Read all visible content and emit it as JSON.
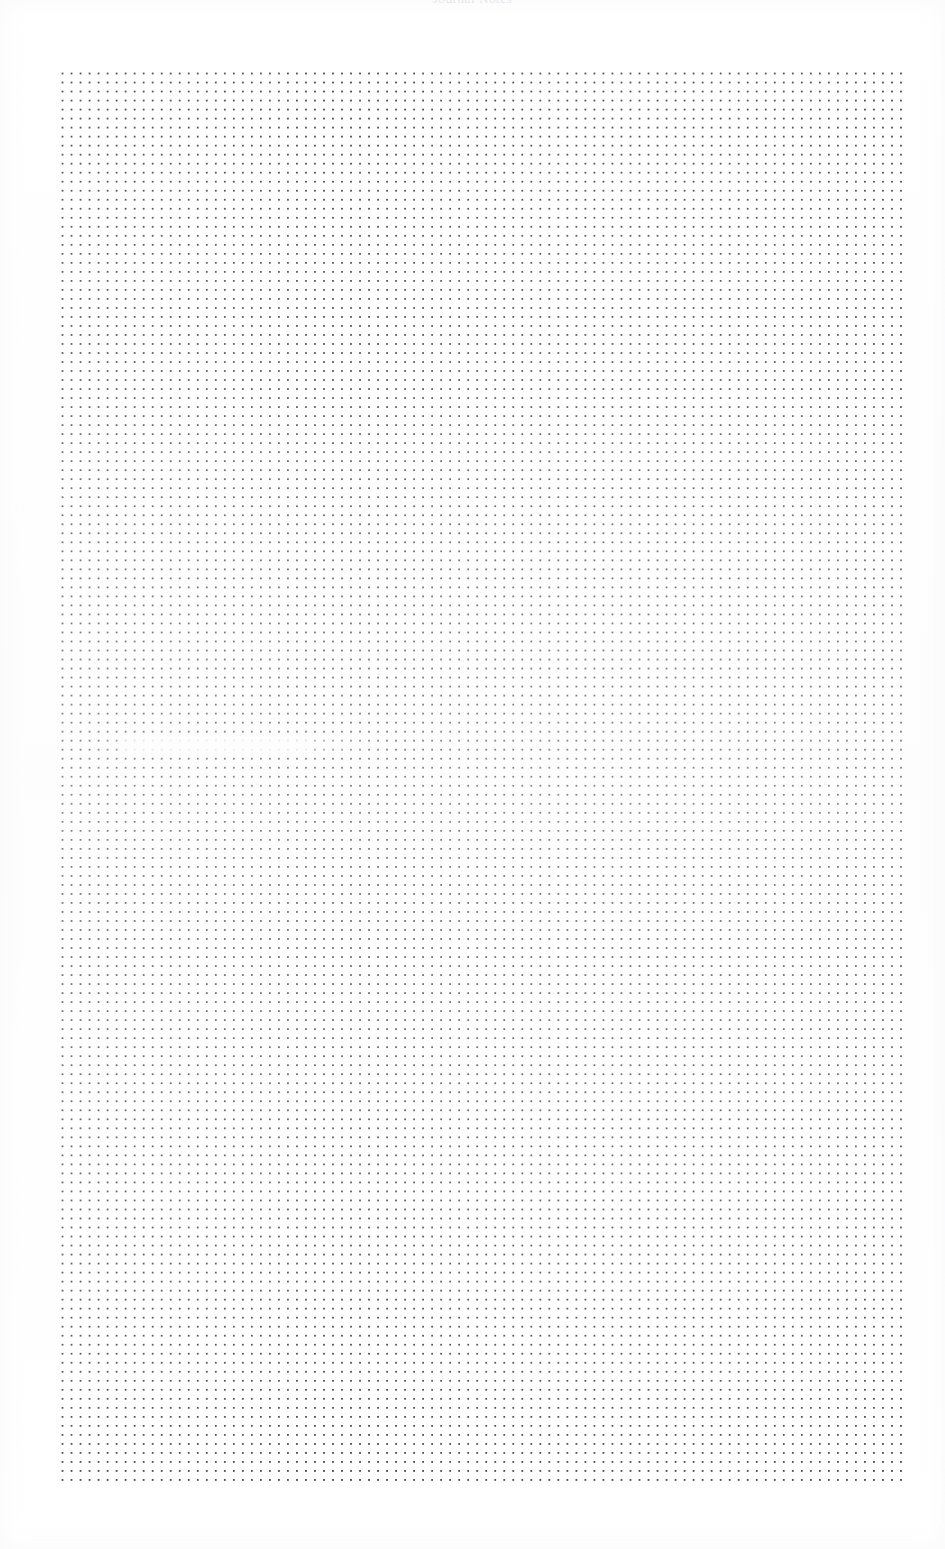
{
  "document": {
    "kind": "dot-grid-notebook-page",
    "header_text": "Journal Notes",
    "header_visibility": "clipped-at-top-edge",
    "background_color": "#ffffff",
    "page_width_px": 945,
    "page_height_px": 1549
  },
  "grid": {
    "label": "dot grid",
    "dot_color": "#4a4a52",
    "dot_spacing_px": 9,
    "dot_radius_px": 1,
    "left_px": 57,
    "top_px": 68,
    "width_px": 849,
    "height_px": 1419,
    "columns": 95,
    "rows": 158
  },
  "margins": {
    "left_px": 57,
    "right_px": 39,
    "top_px": 68,
    "bottom_px": 62
  },
  "annotations": [
    {
      "name": "faded-dot-band",
      "description": "faint lightened horizontal band of dots",
      "left_px": 120,
      "top_px": 740,
      "width_px": 190,
      "height_px": 11
    }
  ]
}
